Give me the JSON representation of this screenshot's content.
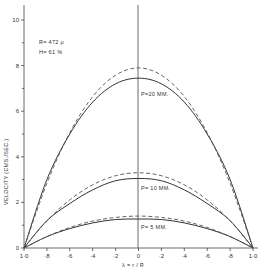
{
  "chart_data": {
    "type": "line",
    "title": "",
    "xlabel": "λ = r / R",
    "ylabel": "VELOCITY (CMS./SEC.)",
    "xlim": [
      -1.0,
      1.0
    ],
    "ylim": [
      0,
      10.5
    ],
    "x_tick_labels": [
      "1·0",
      "·8",
      "·6",
      "·4",
      "·2",
      "0",
      "·2",
      "·4",
      "·6",
      "·8",
      "1·0"
    ],
    "x_ticks": [
      -1.0,
      -0.8,
      -0.6,
      -0.4,
      -0.2,
      0,
      0.2,
      0.4,
      0.6,
      0.8,
      1.0
    ],
    "y_ticks": [
      0,
      2,
      4,
      6,
      8,
      10
    ],
    "y_tick_labels": [
      "0",
      "2",
      "4",
      "6",
      "8",
      "10"
    ],
    "grid": false,
    "annotations": {
      "radius": "R= 472 μ",
      "hematocrit": "H= 61 %",
      "p20": "P=20 MM.",
      "p10": "P= 10 MM.",
      "p5": "P= 5 MM."
    },
    "x": [
      -1.0,
      -0.8,
      -0.6,
      -0.4,
      -0.2,
      0,
      0.2,
      0.4,
      0.6,
      0.8,
      1.0
    ],
    "series": [
      {
        "name": "P=20 MM. (measured)",
        "style": "solid",
        "values": [
          0,
          3.0,
          5.0,
          6.4,
          7.2,
          7.45,
          7.2,
          6.4,
          5.0,
          3.0,
          0
        ]
      },
      {
        "name": "P=20 MM. (parabolic)",
        "style": "dashed",
        "values": [
          0,
          2.84,
          5.06,
          6.64,
          7.58,
          7.9,
          7.58,
          6.64,
          5.06,
          2.84,
          0
        ]
      },
      {
        "name": "P=10 MM. (measured)",
        "style": "solid",
        "values": [
          0,
          1.2,
          1.95,
          2.55,
          2.95,
          3.05,
          2.95,
          2.55,
          1.95,
          1.2,
          0
        ]
      },
      {
        "name": "P=10 MM. (parabolic)",
        "style": "dashed",
        "values": [
          0,
          1.19,
          2.11,
          2.77,
          3.17,
          3.3,
          3.17,
          2.77,
          2.11,
          1.19,
          0
        ]
      },
      {
        "name": "P=5 MM. (measured)",
        "style": "solid",
        "values": [
          0,
          0.5,
          0.85,
          1.1,
          1.25,
          1.27,
          1.25,
          1.1,
          0.85,
          0.5,
          0
        ]
      },
      {
        "name": "P=5 MM. (parabolic)",
        "style": "dashed",
        "values": [
          0,
          0.5,
          0.9,
          1.18,
          1.34,
          1.4,
          1.34,
          1.18,
          0.9,
          0.5,
          0
        ]
      }
    ]
  }
}
